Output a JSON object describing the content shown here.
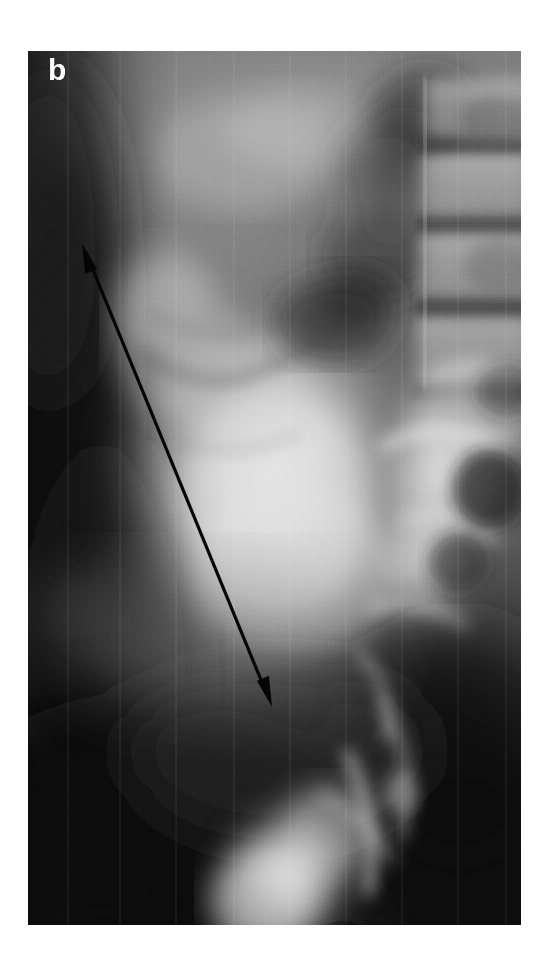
{
  "figure": {
    "domain": "medical-radiograph",
    "page_background": "#ffffff",
    "panel_label": "b",
    "panel_label_color": "#fdfdfd",
    "modality_description": "grayscale abdominal contrast radiograph",
    "panel": {
      "left": 28,
      "top": 51,
      "width": 493,
      "height": 874,
      "border_color": "#ffffff"
    }
  },
  "annotations": {
    "arrow": {
      "name": "double-headed-measurement-arrow",
      "color": "#0a0a0a",
      "shaft_width": 3.2,
      "head_length": 30,
      "head_half_width": 9,
      "start_x": 54,
      "start_y": 192,
      "end_x": 244,
      "end_y": 656,
      "double_headed": true
    }
  },
  "anatomy_regions": [
    {
      "name": "bowel-gas-dark-left-band",
      "tone": "#232323"
    },
    {
      "name": "soft-tissue-midfield",
      "tone": "#8d8d8d"
    },
    {
      "name": "contrast-opacified-mass",
      "tone": "#d8d8d8"
    },
    {
      "name": "lumbar-vertebral-bodies",
      "tone": "#b4b4b4"
    },
    {
      "name": "intervertebral-disc-spaces",
      "tone": "#4a4a4a"
    },
    {
      "name": "sacrum-iliac-bone-bright",
      "tone": "#e8e8e8"
    },
    {
      "name": "pelvic-dark-background",
      "tone": "#151515"
    }
  ],
  "tones": {
    "white": "#ffffff",
    "near_black": "#0a0a0a",
    "plate_base": "#3a3a3a"
  }
}
